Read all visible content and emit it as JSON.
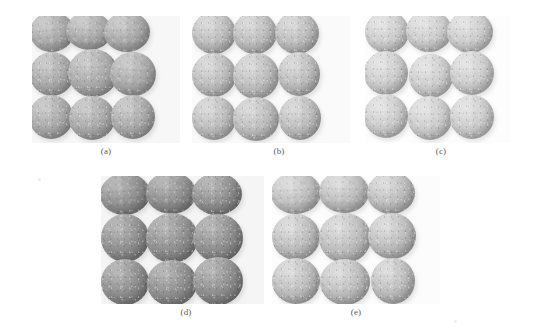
{
  "figure": {
    "type": "multi-panel-photograph-figure",
    "background_color": "#ffffff",
    "width": 541,
    "height": 336,
    "panel_count": 5,
    "caption_color": "#5a5a5a"
  },
  "panels": [
    {
      "id": "a",
      "caption": "(a)",
      "row": 1,
      "column": 1,
      "x": 32,
      "y": 16,
      "width": 148,
      "height": 127,
      "caption_x": 106,
      "caption_y": 146,
      "tone": "medium-gray",
      "base_color": "#a9a9a9",
      "highlight_color": "#cfcfcf",
      "shadow_color": "#7f7f7f",
      "background_color": "#f7f7f7",
      "rows": 3,
      "cols": 3,
      "sphere_count": 9
    },
    {
      "id": "b",
      "caption": "(b)",
      "row": 1,
      "column": 2,
      "x": 192,
      "y": 16,
      "width": 158,
      "height": 127,
      "caption_x": 279,
      "caption_y": 146,
      "tone": "light-gray",
      "base_color": "#bcbcbc",
      "highlight_color": "#dedede",
      "shadow_color": "#8f8f8f",
      "background_color": "#fafafa",
      "rows": 3,
      "cols": 3,
      "sphere_count": 9
    },
    {
      "id": "c",
      "caption": "(c)",
      "row": 1,
      "column": 3,
      "x": 365,
      "y": 16,
      "width": 146,
      "height": 127,
      "caption_x": 441,
      "caption_y": 146,
      "tone": "very-light-gray",
      "base_color": "#cccccc",
      "highlight_color": "#e8e8e8",
      "shadow_color": "#9f9f9f",
      "background_color": "#fdfdfd",
      "rows": 3,
      "cols": 3,
      "sphere_count": 9
    },
    {
      "id": "d",
      "caption": "(d)",
      "row": 2,
      "column": 1,
      "x": 101,
      "y": 176,
      "width": 163,
      "height": 128,
      "caption_x": 186,
      "caption_y": 307,
      "tone": "dark-gray",
      "base_color": "#8e8e8e",
      "highlight_color": "#bcbcbc",
      "shadow_color": "#636363",
      "background_color": "#f5f5f5",
      "rows": 3,
      "cols": 3,
      "sphere_count": 9
    },
    {
      "id": "e",
      "caption": "(e)",
      "row": 2,
      "column": 2,
      "x": 272,
      "y": 176,
      "width": 168,
      "height": 128,
      "caption_x": 356,
      "caption_y": 307,
      "tone": "light-gray",
      "base_color": "#bdbdbd",
      "highlight_color": "#e2e2e2",
      "shadow_color": "#8d8d8d",
      "background_color": "#fcfcfc",
      "rows": 3,
      "cols": 3,
      "sphere_count": 9
    }
  ],
  "spheres": {
    "a": [
      {
        "cx": 20,
        "cy": 16,
        "rx": 22,
        "ry": 20,
        "rot": -6
      },
      {
        "cx": 57,
        "cy": 15,
        "rx": 23,
        "ry": 19,
        "rot": 3
      },
      {
        "cx": 95,
        "cy": 16,
        "rx": 23,
        "ry": 20,
        "rot": -2
      },
      {
        "cx": 20,
        "cy": 58,
        "rx": 22,
        "ry": 22,
        "rot": 0
      },
      {
        "cx": 61,
        "cy": 57,
        "rx": 25,
        "ry": 24,
        "rot": 0
      },
      {
        "cx": 101,
        "cy": 58,
        "rx": 23,
        "ry": 22,
        "rot": 4
      },
      {
        "cx": 19,
        "cy": 101,
        "rx": 22,
        "ry": 22,
        "rot": 0
      },
      {
        "cx": 60,
        "cy": 102,
        "rx": 23,
        "ry": 22,
        "rot": 0
      },
      {
        "cx": 101,
        "cy": 101,
        "rx": 22,
        "ry": 22,
        "rot": 0
      }
    ],
    "b": [
      {
        "cx": 22,
        "cy": 17,
        "rx": 22,
        "ry": 21,
        "rot": 0
      },
      {
        "cx": 63,
        "cy": 17,
        "rx": 22,
        "ry": 21,
        "rot": 0
      },
      {
        "cx": 105,
        "cy": 17,
        "rx": 22,
        "ry": 21,
        "rot": 0
      },
      {
        "cx": 22,
        "cy": 59,
        "rx": 22,
        "ry": 22,
        "rot": 0
      },
      {
        "cx": 64,
        "cy": 60,
        "rx": 23,
        "ry": 23,
        "rot": 0
      },
      {
        "cx": 107,
        "cy": 58,
        "rx": 21,
        "ry": 22,
        "rot": 0
      },
      {
        "cx": 22,
        "cy": 102,
        "rx": 22,
        "ry": 22,
        "rot": 0
      },
      {
        "cx": 64,
        "cy": 103,
        "rx": 23,
        "ry": 22,
        "rot": 0
      },
      {
        "cx": 108,
        "cy": 102,
        "rx": 21,
        "ry": 22,
        "rot": 0
      }
    ],
    "c": [
      {
        "cx": 22,
        "cy": 16,
        "rx": 22,
        "ry": 21,
        "rot": 0
      },
      {
        "cx": 64,
        "cy": 15,
        "rx": 23,
        "ry": 21,
        "rot": 0
      },
      {
        "cx": 105,
        "cy": 16,
        "rx": 23,
        "ry": 21,
        "rot": 0
      },
      {
        "cx": 21,
        "cy": 57,
        "rx": 22,
        "ry": 22,
        "rot": 0
      },
      {
        "cx": 66,
        "cy": 60,
        "rx": 22,
        "ry": 22,
        "rot": 0
      },
      {
        "cx": 107,
        "cy": 57,
        "rx": 22,
        "ry": 22,
        "rot": 0
      },
      {
        "cx": 21,
        "cy": 100,
        "rx": 22,
        "ry": 22,
        "rot": 0
      },
      {
        "cx": 65,
        "cy": 102,
        "rx": 22,
        "ry": 22,
        "rot": 0
      },
      {
        "cx": 107,
        "cy": 101,
        "rx": 22,
        "ry": 22,
        "rot": 0
      }
    ],
    "d": [
      {
        "cx": 24,
        "cy": 18,
        "rx": 25,
        "ry": 21,
        "rot": -4
      },
      {
        "cx": 70,
        "cy": 17,
        "rx": 25,
        "ry": 21,
        "rot": 2
      },
      {
        "cx": 116,
        "cy": 18,
        "rx": 25,
        "ry": 21,
        "rot": 0
      },
      {
        "cx": 24,
        "cy": 62,
        "rx": 24,
        "ry": 24,
        "rot": 0
      },
      {
        "cx": 71,
        "cy": 62,
        "rx": 26,
        "ry": 25,
        "rot": 0
      },
      {
        "cx": 117,
        "cy": 62,
        "rx": 25,
        "ry": 24,
        "rot": 0
      },
      {
        "cx": 24,
        "cy": 106,
        "rx": 24,
        "ry": 23,
        "rot": 0
      },
      {
        "cx": 71,
        "cy": 107,
        "rx": 25,
        "ry": 23,
        "rot": 0
      },
      {
        "cx": 117,
        "cy": 105,
        "rx": 25,
        "ry": 24,
        "rot": 0
      }
    ],
    "e": [
      {
        "cx": 24,
        "cy": 17,
        "rx": 25,
        "ry": 21,
        "rot": -3
      },
      {
        "cx": 72,
        "cy": 16,
        "rx": 25,
        "ry": 21,
        "rot": 2
      },
      {
        "cx": 119,
        "cy": 17,
        "rx": 24,
        "ry": 21,
        "rot": 0
      },
      {
        "cx": 24,
        "cy": 61,
        "rx": 24,
        "ry": 23,
        "rot": 0
      },
      {
        "cx": 73,
        "cy": 62,
        "rx": 26,
        "ry": 25,
        "rot": 0
      },
      {
        "cx": 120,
        "cy": 60,
        "rx": 24,
        "ry": 23,
        "rot": 0
      },
      {
        "cx": 24,
        "cy": 105,
        "rx": 24,
        "ry": 23,
        "rot": 0
      },
      {
        "cx": 73,
        "cy": 106,
        "rx": 25,
        "ry": 23,
        "rot": 0
      },
      {
        "cx": 121,
        "cy": 105,
        "rx": 22,
        "ry": 23,
        "rot": 0
      }
    ]
  },
  "artifacts": [
    {
      "x": 38,
      "y": 178,
      "w": 3,
      "h": 3
    },
    {
      "x": 454,
      "y": 320,
      "w": 3,
      "h": 3
    }
  ]
}
